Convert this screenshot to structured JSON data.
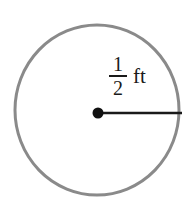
{
  "diagram": {
    "shape": "circle",
    "radius_label": {
      "numerator": "1",
      "denominator": "2",
      "unit": "ft"
    },
    "colors": {
      "circle_stroke": "#8a8a8a",
      "radius_line": "#1a1a1a",
      "center_dot": "#111111",
      "background": "#ffffff"
    }
  }
}
